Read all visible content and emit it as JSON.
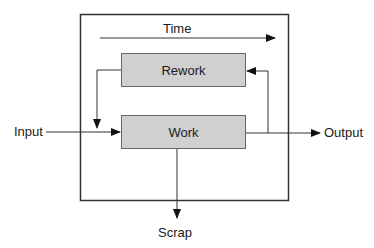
{
  "diagram": {
    "type": "process-flow",
    "container": {
      "label": ""
    },
    "time_label": "Time",
    "boxes": {
      "rework": {
        "label": "Rework",
        "fill": "#d0d0d0"
      },
      "work": {
        "label": "Work",
        "fill": "#d0d0d0"
      }
    },
    "flows": {
      "input": "Input",
      "output": "Output",
      "scrap": "Scrap"
    },
    "edges": [
      {
        "from": "Input",
        "to": "Work"
      },
      {
        "from": "Work",
        "to": "Output"
      },
      {
        "from": "Work",
        "to": "Scrap"
      },
      {
        "from": "Work",
        "to": "Rework"
      },
      {
        "from": "Rework",
        "to": "Work"
      }
    ],
    "colors": {
      "line": "#333333",
      "box_fill": "#d0d0d0",
      "box_border": "#555555"
    }
  }
}
